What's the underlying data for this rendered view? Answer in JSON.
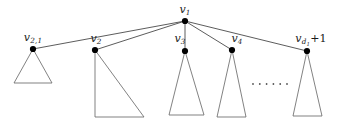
{
  "figure": {
    "kind": "rooted-tree-diagram",
    "width": 340,
    "height": 121,
    "background_color": "#ffffff",
    "stroke_color": "#4a4a4a",
    "node_color": "#000000",
    "label_color": "#1a1a1a"
  },
  "root": {
    "id": "v1",
    "label_html": "v<sub>1</sub>",
    "label_text": "v_1",
    "x": 185,
    "y": 21,
    "label_x": 185,
    "label_y": 4
  },
  "children": [
    {
      "id": "v2_1",
      "label_html": "v<sub>2,1</sub>",
      "label_text": "v_{2,1}",
      "x": 33,
      "y": 49,
      "label_x": 33,
      "label_y": 32,
      "subtree": {
        "shape": "triangle-isosceles",
        "apex_x": 33,
        "apex_y": 49,
        "base_left_x": 14,
        "base_right_x": 52,
        "base_y": 83
      }
    },
    {
      "id": "v2",
      "label_html": "v<sub>2</sub>",
      "label_text": "v_2",
      "x": 95,
      "y": 50,
      "label_x": 96,
      "label_y": 33,
      "subtree": {
        "shape": "triangle-right",
        "apex_x": 95,
        "apex_y": 50,
        "base_left_x": 95,
        "base_right_x": 144,
        "base_y": 117
      }
    },
    {
      "id": "v3",
      "label_html": "v<sub>3</sub>",
      "label_text": "v_3",
      "x": 185,
      "y": 51,
      "label_x": 180,
      "label_y": 33,
      "subtree": {
        "shape": "triangle-isosceles",
        "apex_x": 185,
        "apex_y": 51,
        "base_left_x": 169,
        "base_right_x": 204,
        "base_y": 115
      }
    },
    {
      "id": "v4",
      "label_html": "v<sub>4</sub>",
      "label_text": "v_4",
      "x": 232,
      "y": 50,
      "label_x": 237,
      "label_y": 33,
      "subtree": {
        "shape": "triangle-isosceles",
        "apex_x": 232,
        "apex_y": 50,
        "base_left_x": 217,
        "base_right_x": 246,
        "base_y": 117
      }
    },
    {
      "id": "vd1plus1",
      "label_html": "v<sub>d<sub>1</sub></sub><span class=\"op\">+1</span>",
      "label_text": "v_{d_1+1}",
      "x": 307,
      "y": 51,
      "label_x": 311,
      "label_y": 33,
      "subtree": {
        "shape": "triangle-isosceles",
        "apex_x": 307,
        "apex_y": 51,
        "base_left_x": 293,
        "base_right_x": 322,
        "base_y": 116
      }
    }
  ],
  "ellipsis": {
    "label": "......",
    "dot_count": 6,
    "start_x": 253,
    "end_x": 287,
    "y": 84,
    "dot_radius": 0.9
  }
}
